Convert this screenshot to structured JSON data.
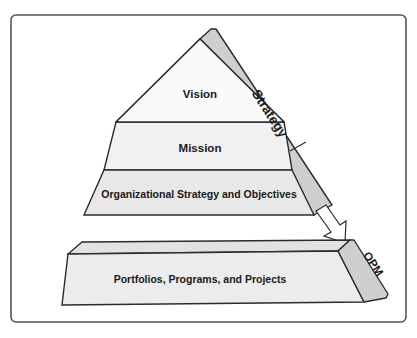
{
  "diagram": {
    "type": "pyramid-with-base",
    "pyramid": {
      "side_label": "Strategy",
      "levels": [
        {
          "label": "Vision"
        },
        {
          "label": "Mission"
        },
        {
          "label": "Organizational Strategy and Objectives"
        }
      ]
    },
    "base": {
      "label": "Portfolios, Programs, and Projects",
      "side_label": "OPM"
    },
    "connector": {
      "type": "arrow",
      "from": "Strategy",
      "to": "OPM"
    },
    "colors": {
      "outline": "#2b2b2b",
      "face_top": "#fafafa",
      "face_mid": "#f1f1f1",
      "face_bottom": "#e8e8e8",
      "side_band": "#cfcfcf",
      "frame": "#555555"
    }
  }
}
